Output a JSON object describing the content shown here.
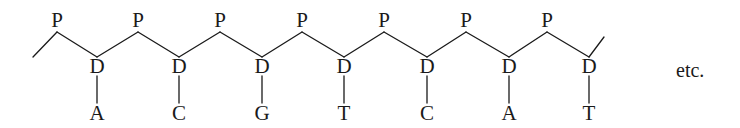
{
  "diagram": {
    "phosphate_label": "P",
    "sugar_label": "D",
    "continuation_label": "etc.",
    "line_color": "#1a1a1a",
    "phosphates": [
      {
        "label": "P",
        "x": 57
      },
      {
        "label": "P",
        "x": 138
      },
      {
        "label": "P",
        "x": 220
      },
      {
        "label": "P",
        "x": 302
      },
      {
        "label": "P",
        "x": 384
      },
      {
        "label": "P",
        "x": 466
      },
      {
        "label": "P",
        "x": 547
      }
    ],
    "nucleotides": [
      {
        "sugar": "D",
        "base": "A",
        "x": 97
      },
      {
        "sugar": "D",
        "base": "C",
        "x": 179
      },
      {
        "sugar": "D",
        "base": "G",
        "x": 262
      },
      {
        "sugar": "D",
        "base": "T",
        "x": 344
      },
      {
        "sugar": "D",
        "base": "C",
        "x": 427
      },
      {
        "sugar": "D",
        "base": "A",
        "x": 509
      },
      {
        "sugar": "D",
        "base": "T",
        "x": 589
      }
    ],
    "base_sequence": [
      "A",
      "C",
      "G",
      "T",
      "C",
      "A",
      "T"
    ]
  }
}
